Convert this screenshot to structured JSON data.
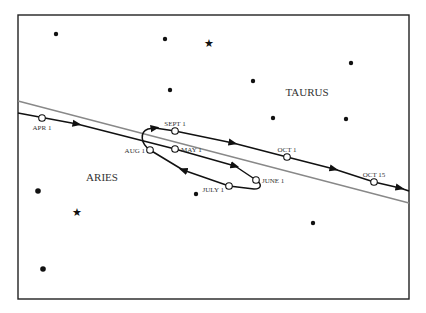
{
  "diagram": {
    "title": "",
    "constellations": [
      {
        "name": "TAURUS",
        "x": 307,
        "y": 96
      },
      {
        "name": "ARIES",
        "x": 102,
        "y": 181
      }
    ],
    "colors": {
      "frame": "#222222",
      "path": "#111111",
      "ecliptic": "#888888",
      "text": "#333333",
      "marker_fill": "#ffffff"
    },
    "ecliptic": {
      "x1": 18,
      "y1": 101,
      "x2": 409,
      "y2": 203
    },
    "date_markers": [
      {
        "label": "APR 1",
        "x": 42,
        "y": 118,
        "lx": 42,
        "ly": 130,
        "anchor": "middle"
      },
      {
        "label": "MAY 1",
        "x": 175,
        "y": 149,
        "lx": 181,
        "ly": 152,
        "anchor": "start"
      },
      {
        "label": "JUNE 1",
        "x": 256,
        "y": 180,
        "lx": 262,
        "ly": 183,
        "anchor": "start"
      },
      {
        "label": "JULY 1",
        "x": 229,
        "y": 186,
        "lx": 224,
        "ly": 192,
        "anchor": "end"
      },
      {
        "label": "AUG 1",
        "x": 150,
        "y": 150,
        "lx": 145,
        "ly": 153,
        "anchor": "end"
      },
      {
        "label": "SEPT 1",
        "x": 175,
        "y": 131,
        "lx": 175,
        "ly": 126,
        "anchor": "middle"
      },
      {
        "label": "OCT 1",
        "x": 287,
        "y": 157,
        "lx": 287,
        "ly": 152,
        "anchor": "middle"
      },
      {
        "label": "OCT 15",
        "x": 374,
        "y": 182,
        "lx": 374,
        "ly": 177,
        "anchor": "middle"
      }
    ],
    "stars_dots": [
      {
        "x": 56,
        "y": 34,
        "r": 2.2
      },
      {
        "x": 165,
        "y": 39,
        "r": 2.2
      },
      {
        "x": 170,
        "y": 90,
        "r": 2.2
      },
      {
        "x": 253,
        "y": 81,
        "r": 2.2
      },
      {
        "x": 351,
        "y": 63,
        "r": 2.2
      },
      {
        "x": 273,
        "y": 118,
        "r": 2.2
      },
      {
        "x": 346,
        "y": 119,
        "r": 2.2
      },
      {
        "x": 196,
        "y": 194,
        "r": 2.2
      },
      {
        "x": 313,
        "y": 223,
        "r": 2.2
      },
      {
        "x": 38,
        "y": 191,
        "r": 2.8
      },
      {
        "x": 43,
        "y": 269,
        "r": 2.8
      }
    ],
    "stars_glyph": [
      {
        "x": 209,
        "y": 43,
        "glyph": "★"
      },
      {
        "x": 77,
        "y": 212,
        "glyph": "★"
      }
    ]
  }
}
